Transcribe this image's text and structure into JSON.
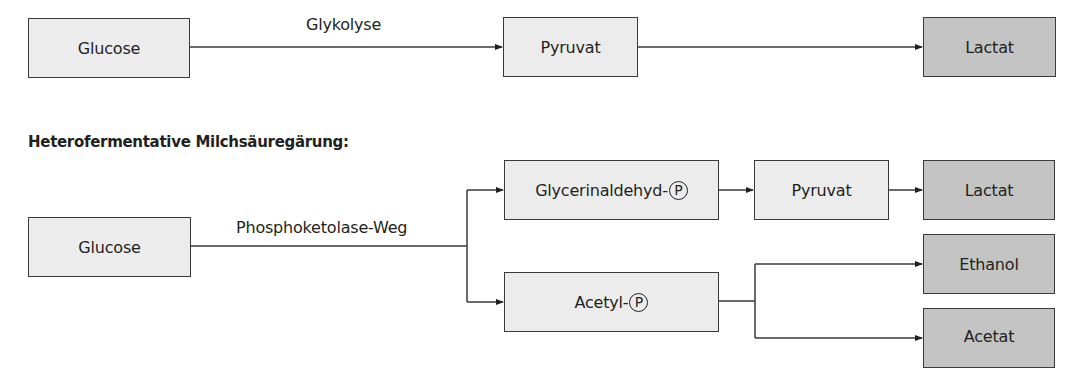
{
  "homofermentative": {
    "boxes": {
      "glucose": "Glucose",
      "pyruvat": "Pyruvat",
      "lactat": "Lactat"
    },
    "edge_label": "Glykolyse"
  },
  "heterofermentative": {
    "heading": "Heterofermentative Milchsäuregärung:",
    "edge_label": "Phosphoketolase-Weg",
    "boxes": {
      "glucose": "Glucose",
      "glycerinaldehyd": "Glycerinaldehyd-",
      "acetyl": "Acetyl-",
      "pyruvat": "Pyruvat",
      "lactat": "Lactat",
      "ethanol": "Ethanol",
      "acetat": "Acetat"
    },
    "phosphate_symbol": "P"
  },
  "colors": {
    "intermediate_fill": "#ececec",
    "product_fill": "#c4c4c4",
    "stroke": "#3a3a3a"
  }
}
